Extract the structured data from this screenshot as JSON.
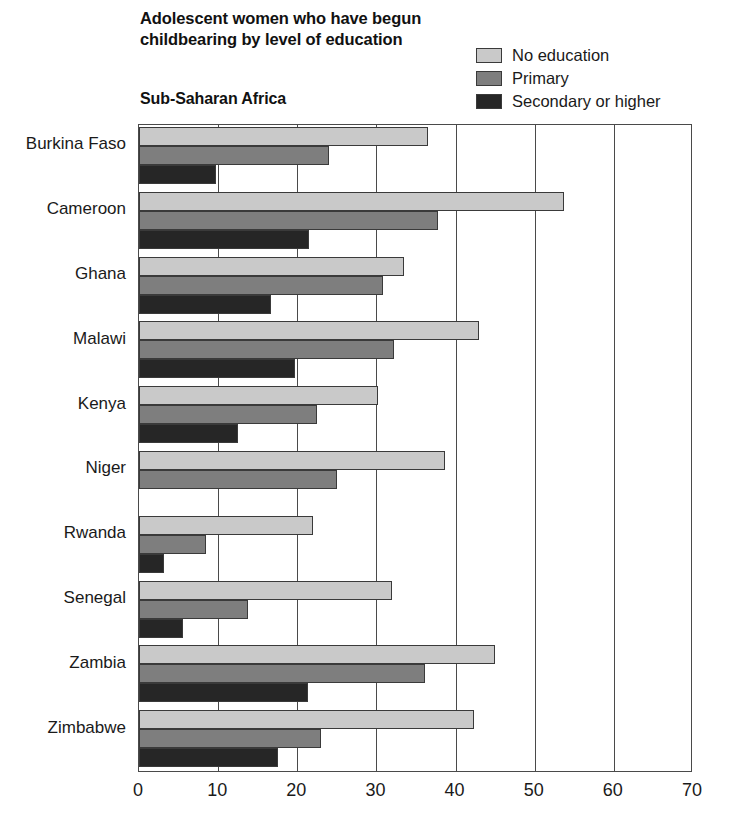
{
  "chart_data": {
    "type": "bar",
    "orientation": "horizontal",
    "title": "Adolescent women who have begun childbearing by level of education",
    "title_lines": [
      "Adolescent women who have begun",
      "childbearing by level of education"
    ],
    "subtitle": "Sub-Saharan Africa",
    "xlabel": "",
    "ylabel": "",
    "xlim": [
      0,
      70
    ],
    "xticks": [
      0,
      10,
      20,
      30,
      40,
      50,
      60,
      70
    ],
    "xtick_labels": [
      "0",
      "10",
      "20",
      "30",
      "40",
      "50",
      "60",
      "70"
    ],
    "grid": "vertical",
    "legend_position": "top-right",
    "categories": [
      "Burkina Faso",
      "Cameroon",
      "Ghana",
      "Malawi",
      "Kenya",
      "Niger",
      "Rwanda",
      "Senegal",
      "Zambia",
      "Zimbabwe"
    ],
    "series": [
      {
        "name": "No education",
        "color": "#c9c9c9",
        "values": [
          36.5,
          53.7,
          33.5,
          43.0,
          30.2,
          38.7,
          22.0,
          32.0,
          45.0,
          42.3
        ]
      },
      {
        "name": "Primary",
        "color": "#7e7e7e",
        "values": [
          24.0,
          37.8,
          30.8,
          32.2,
          22.5,
          25.0,
          8.5,
          13.8,
          36.2,
          23.0
        ]
      },
      {
        "name": "Secondary or higher",
        "color": "#262626",
        "values": [
          9.7,
          21.5,
          16.7,
          19.7,
          12.5,
          0,
          3.2,
          5.5,
          21.3,
          17.5
        ]
      }
    ]
  },
  "legend": {
    "items": [
      {
        "label": "No education",
        "color": "#c9c9c9"
      },
      {
        "label": "Primary",
        "color": "#7e7e7e"
      },
      {
        "label": "Secondary or higher",
        "color": "#262626"
      }
    ]
  }
}
